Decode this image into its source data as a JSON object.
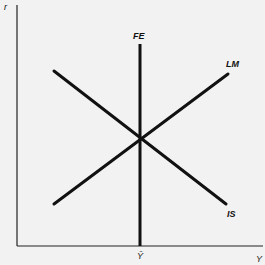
{
  "diagram": {
    "axes": {
      "y_label": "r",
      "x_label": "Y",
      "x_tick_label": "Ȳ"
    },
    "curves": [
      {
        "id": "FE",
        "label": "FE",
        "kind": "vertical",
        "description": "Full-employment line at Ȳ"
      },
      {
        "id": "LM",
        "label": "LM",
        "kind": "upward-sloping"
      },
      {
        "id": "IS",
        "label": "IS",
        "kind": "downward-sloping"
      }
    ],
    "equilibrium": {
      "description": "IS, LM and FE intersect at a single point at output Ȳ"
    },
    "colors": {
      "line": "#111111",
      "background": "#f2f2f2"
    }
  }
}
